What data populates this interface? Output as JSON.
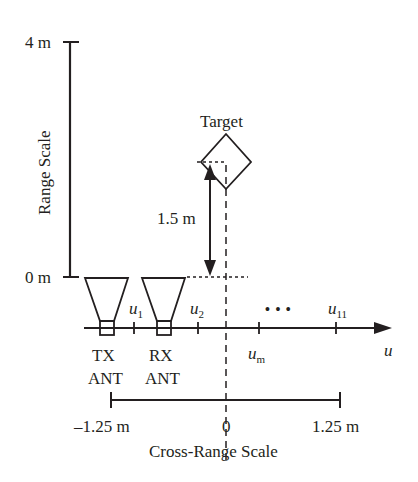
{
  "range_axis": {
    "label": "Range Scale",
    "top_tick": "4 m",
    "bottom_tick": "0 m"
  },
  "target": {
    "label": "Target",
    "distance_label": "1.5 m"
  },
  "antennas": {
    "tx_line1": "TX",
    "tx_line2": "ANT",
    "rx_line1": "RX",
    "rx_line2": "ANT"
  },
  "u_axis": {
    "label": "u",
    "positions": [
      {
        "base": "u",
        "sub": "1"
      },
      {
        "base": "u",
        "sub": "2"
      },
      {
        "base": "u",
        "sub": "m"
      },
      {
        "base": "u",
        "sub": "11"
      }
    ],
    "ellipsis": "• • •"
  },
  "cross_range_axis": {
    "label": "Cross-Range Scale",
    "left_tick": "–1.25 m",
    "center_tick": "0",
    "right_tick": "1.25 m"
  },
  "colors": {
    "ink": "#231f20",
    "background": "#ffffff"
  }
}
